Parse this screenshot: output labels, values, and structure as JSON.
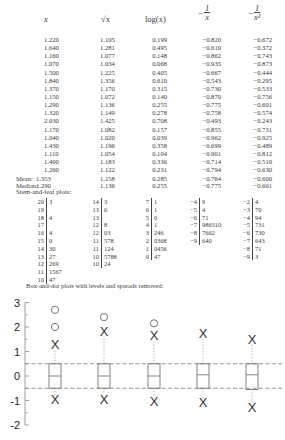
{
  "headers": {
    "x": "x",
    "sqrt": "√x",
    "log": "log(x)",
    "neg_inv": {
      "sign": "−",
      "num": "1",
      "den": "x"
    },
    "neg_inv_sq": {
      "sign": "−",
      "num": "1",
      "den": "x²"
    }
  },
  "rows": [
    [
      "1.220",
      "1.105",
      "0.199",
      "−0.820",
      "−0.672"
    ],
    [
      "1.640",
      "1.281",
      "0.495",
      "−0.610",
      "−0.372"
    ],
    [
      "1.160",
      "1.077",
      "0.148",
      "−0.862",
      "−0.743"
    ],
    [
      "1.070",
      "1.034",
      "0.068",
      "−0.935",
      "−0.873"
    ],
    [
      "1.500",
      "1.225",
      "0.405",
      "−0.667",
      "−0.444"
    ],
    [
      "1.840",
      "1.356",
      "0.610",
      "−0.543",
      "−0.295"
    ],
    [
      "1.370",
      "1.170",
      "0.315",
      "−0.730",
      "−0.533"
    ],
    [
      "1.150",
      "1.072",
      "0.140",
      "−0.870",
      "−0.756"
    ],
    [
      "1.290",
      "1.136",
      "0.255",
      "−0.775",
      "−0.601"
    ],
    [
      "1.320",
      "1.149",
      "0.278",
      "−0.758",
      "−0.574"
    ],
    [
      "2.030",
      "1.425",
      "0.708",
      "−0.493",
      "−0.243"
    ],
    [
      "1.170",
      "1.082",
      "0.157",
      "−0.855",
      "−0.731"
    ],
    [
      "1.040",
      "1.020",
      "0.039",
      "−0.962",
      "−0.925"
    ],
    [
      "1.430",
      "1.196",
      "0.358",
      "−0.699",
      "−0.489"
    ],
    [
      "1.110",
      "1.054",
      "0.104",
      "−0.901",
      "−0.812"
    ],
    [
      "1.400",
      "1.183",
      "0.336",
      "−0.714",
      "−0.510"
    ],
    [
      "1.260",
      "1.122",
      "0.231",
      "−0.794",
      "−0.630"
    ]
  ],
  "summary": {
    "mean_label": "Mean:",
    "mean": [
      "1.353",
      "1.158",
      "0.285",
      "−0.764",
      "−0.600"
    ],
    "median_label": "Median:",
    "median": [
      "1.290",
      "1.136",
      "0.255",
      "−0.775",
      "−0.601"
    ]
  },
  "stem_leaf_title": "Stem-and-leaf plots:",
  "stem_leaf": [
    [
      [
        "20",
        "3"
      ],
      [
        "19",
        ""
      ],
      [
        "18",
        "4"
      ],
      [
        "17",
        ""
      ],
      [
        "16",
        "4"
      ],
      [
        "15",
        "0"
      ],
      [
        "14",
        "30"
      ],
      [
        "13",
        "27"
      ],
      [
        "12",
        "269"
      ],
      [
        "11",
        "1567"
      ],
      [
        "10",
        "47"
      ]
    ],
    [
      [
        "14",
        "3"
      ],
      [
        "13",
        "6"
      ],
      [
        "13",
        ""
      ],
      [
        "12",
        "8"
      ],
      [
        "12",
        "03"
      ],
      [
        "11",
        "578"
      ],
      [
        "11",
        "124"
      ],
      [
        "10",
        "5788"
      ],
      [
        "10",
        "24"
      ]
    ],
    [
      [
        "7",
        "1"
      ],
      [
        "6",
        "1"
      ],
      [
        "5",
        "0"
      ],
      [
        "4",
        "1"
      ],
      [
        "3",
        "246"
      ],
      [
        "2",
        "0368"
      ],
      [
        "1",
        "0456"
      ],
      [
        "0",
        "47"
      ]
    ],
    [
      [
        "−4",
        "9"
      ],
      [
        "−5",
        "4"
      ],
      [
        "−6",
        "71"
      ],
      [
        "−7",
        "986310"
      ],
      [
        "−8",
        "7662"
      ],
      [
        "−9",
        "640"
      ]
    ],
    [
      [
        "−2",
        "4"
      ],
      [
        "−3",
        "70"
      ],
      [
        "−4",
        "94"
      ],
      [
        "−5",
        "731"
      ],
      [
        "−6",
        "730"
      ],
      [
        "−7",
        "643"
      ],
      [
        "−8",
        "71"
      ],
      [
        "−9",
        "3"
      ]
    ]
  ],
  "boxplot_title": "Box-and-dot plots with levels and spreads removed:",
  "chart_data": {
    "type": "box",
    "title": "Box-and-dot plots with levels and spreads removed:",
    "ylim": [
      -2,
      3
    ],
    "yticks": [
      "3",
      "2",
      "1",
      "0",
      "-1",
      "-2"
    ],
    "reference_lines": [
      0.5,
      -0.5
    ],
    "series": [
      {
        "name": "x",
        "q1": -0.5,
        "median": 0.0,
        "q3": 0.5,
        "upper_adjacent": 1.27,
        "lower_adjacent": -0.97,
        "outliers": [
          2.0,
          2.7
        ]
      },
      {
        "name": "sqrt(x)",
        "q1": -0.5,
        "median": 0.0,
        "q3": 0.5,
        "upper_adjacent": 1.8,
        "lower_adjacent": -0.97,
        "outliers": [
          2.4
        ]
      },
      {
        "name": "log(x)",
        "q1": -0.5,
        "median": 0.0,
        "q3": 0.5,
        "upper_adjacent": 1.65,
        "lower_adjacent": -1.05,
        "outliers": [
          2.15
        ]
      },
      {
        "name": "-1/x",
        "q1": -0.5,
        "median": 0.05,
        "q3": 0.5,
        "upper_adjacent": 1.75,
        "lower_adjacent": -1.1,
        "outliers": []
      },
      {
        "name": "-1/x^2",
        "q1": -0.55,
        "median": 0.05,
        "q3": 0.5,
        "upper_adjacent": 1.5,
        "lower_adjacent": -1.3,
        "outliers": []
      }
    ]
  }
}
